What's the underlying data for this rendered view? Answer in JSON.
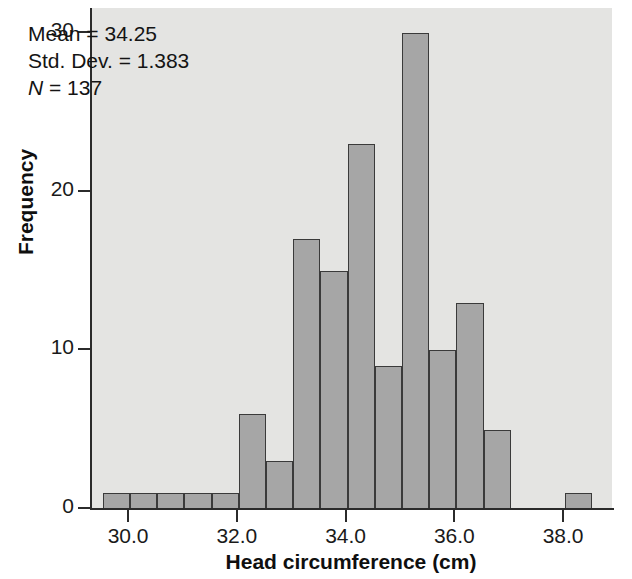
{
  "chart_data": {
    "type": "bar",
    "subtype": "histogram",
    "title": "",
    "xlabel": "Head circumference (cm)",
    "ylabel": "Frequency",
    "xlim": [
      29.3,
      38.9
    ],
    "ylim": [
      0,
      31.5
    ],
    "bin_width": 0.5,
    "grid": false,
    "legend": null,
    "bar_color": "#a6a6a6",
    "bar_edge_color": "#3a3a3a",
    "plot_background": "#e4e4e2",
    "x_ticks": [
      "30.0",
      "32.0",
      "34.0",
      "36.0",
      "38.0"
    ],
    "x_tick_values": [
      30.0,
      32.0,
      34.0,
      36.0,
      38.0
    ],
    "y_ticks": [
      "0",
      "10",
      "20",
      "30"
    ],
    "y_tick_values": [
      0,
      10,
      20,
      30
    ],
    "bins": [
      {
        "left": 29.5,
        "right": 30.0,
        "value": 1
      },
      {
        "left": 30.0,
        "right": 30.5,
        "value": 1
      },
      {
        "left": 30.5,
        "right": 31.0,
        "value": 1
      },
      {
        "left": 31.0,
        "right": 31.5,
        "value": 1
      },
      {
        "left": 31.5,
        "right": 32.0,
        "value": 1
      },
      {
        "left": 32.0,
        "right": 32.5,
        "value": 6
      },
      {
        "left": 32.5,
        "right": 33.0,
        "value": 3
      },
      {
        "left": 33.0,
        "right": 33.5,
        "value": 17
      },
      {
        "left": 33.5,
        "right": 34.0,
        "value": 15
      },
      {
        "left": 34.0,
        "right": 34.5,
        "value": 23
      },
      {
        "left": 34.5,
        "right": 35.0,
        "value": 9
      },
      {
        "left": 35.0,
        "right": 35.5,
        "value": 30
      },
      {
        "left": 35.5,
        "right": 36.0,
        "value": 10
      },
      {
        "left": 36.0,
        "right": 36.5,
        "value": 13
      },
      {
        "left": 36.5,
        "right": 37.0,
        "value": 5
      },
      {
        "left": 38.0,
        "right": 38.5,
        "value": 1
      }
    ],
    "categories": [
      "29.5",
      "30.0",
      "30.5",
      "31.0",
      "31.5",
      "32.0",
      "32.5",
      "33.0",
      "33.5",
      "34.0",
      "34.5",
      "35.0",
      "35.5",
      "36.0",
      "36.5",
      "38.0"
    ],
    "values": [
      1,
      1,
      1,
      1,
      1,
      6,
      3,
      17,
      15,
      23,
      9,
      30,
      10,
      13,
      5,
      1
    ]
  },
  "annotation": {
    "mean_label": "Mean = 34.25",
    "std_dev_label": "Std. Dev. = 1.383",
    "n_symbol": "N",
    "n_label": " = 137"
  }
}
